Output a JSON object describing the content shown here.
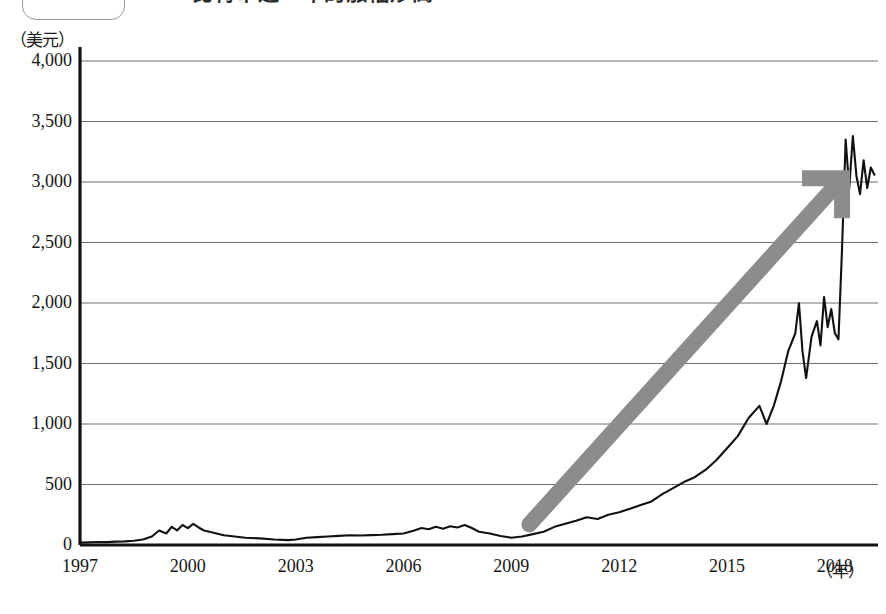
{
  "header": {
    "pill_text": "",
    "headline_clipped": "……比特币近一年的涨幅炒高"
  },
  "chart_data": {
    "type": "line",
    "title": "",
    "xlabel": "（年）",
    "ylabel": "（美元）",
    "y_unit": "（美元）",
    "x_unit": "（年）",
    "grid": true,
    "legend": "none",
    "xlim": [
      1997,
      2019.2
    ],
    "ylim": [
      0,
      4000
    ],
    "ytick_labels": [
      "0",
      "500",
      "1,000",
      "1,500",
      "2,000",
      "2,500",
      "3,000",
      "3,500",
      "4,000"
    ],
    "yticks": [
      0,
      500,
      1000,
      1500,
      2000,
      2500,
      3000,
      3500,
      4000
    ],
    "xtick_labels": [
      "1997",
      "2000",
      "2003",
      "2006",
      "2009",
      "2012",
      "2015",
      "2018"
    ],
    "xticks": [
      1997,
      2000,
      2003,
      2006,
      2009,
      2012,
      2015,
      2018
    ],
    "series": [
      {
        "name": "index",
        "color": "#111111",
        "x": [
          1997.0,
          1997.25,
          1997.5,
          1997.75,
          1998.0,
          1998.25,
          1998.5,
          1998.75,
          1999.0,
          1999.2,
          1999.4,
          1999.55,
          1999.7,
          1999.85,
          2000.0,
          2000.15,
          2000.3,
          2000.45,
          2000.6,
          2000.8,
          2001.0,
          2001.3,
          2001.6,
          2002.0,
          2002.4,
          2002.8,
          2003.0,
          2003.3,
          2003.6,
          2003.9,
          2004.2,
          2004.5,
          2004.8,
          2005.1,
          2005.4,
          2005.7,
          2006.0,
          2006.3,
          2006.5,
          2006.7,
          2006.9,
          2007.1,
          2007.3,
          2007.5,
          2007.7,
          2007.9,
          2008.1,
          2008.4,
          2008.7,
          2009.0,
          2009.3,
          2009.6,
          2009.9,
          2010.2,
          2010.5,
          2010.8,
          2011.1,
          2011.4,
          2011.7,
          2012.0,
          2012.3,
          2012.6,
          2012.9,
          2013.2,
          2013.5,
          2013.8,
          2014.1,
          2014.4,
          2014.7,
          2015.0,
          2015.3,
          2015.6,
          2015.9,
          2016.1,
          2016.3,
          2016.5,
          2016.7,
          2016.9,
          2017.0,
          2017.1,
          2017.2,
          2017.35,
          2017.5,
          2017.6,
          2017.7,
          2017.8,
          2017.9,
          2018.0,
          2018.1,
          2018.2,
          2018.3,
          2018.4,
          2018.5,
          2018.6,
          2018.7,
          2018.8,
          2018.9,
          2019.0,
          2019.1
        ],
        "y": [
          20,
          22,
          25,
          24,
          28,
          30,
          35,
          45,
          70,
          120,
          95,
          150,
          120,
          165,
          140,
          175,
          145,
          120,
          110,
          95,
          80,
          70,
          60,
          55,
          45,
          40,
          45,
          60,
          65,
          70,
          75,
          80,
          78,
          82,
          85,
          90,
          95,
          120,
          140,
          130,
          150,
          135,
          155,
          145,
          165,
          140,
          110,
          95,
          75,
          60,
          70,
          90,
          110,
          150,
          175,
          200,
          230,
          215,
          250,
          270,
          300,
          330,
          360,
          420,
          470,
          520,
          560,
          620,
          700,
          800,
          900,
          1050,
          1150,
          1000,
          1150,
          1350,
          1600,
          1750,
          2000,
          1600,
          1380,
          1720,
          1850,
          1650,
          2050,
          1800,
          1950,
          1750,
          1700,
          2450,
          3350,
          2950,
          3380,
          3050,
          2900,
          3180,
          2950,
          3120,
          3060
        ]
      }
    ],
    "annotations": [
      {
        "name": "growth-arrow",
        "type": "arrow",
        "color": "#8c8c8c",
        "from_year": 2009.5,
        "from_value": 170,
        "to_year": 2018.2,
        "to_value": 3030
      }
    ]
  }
}
